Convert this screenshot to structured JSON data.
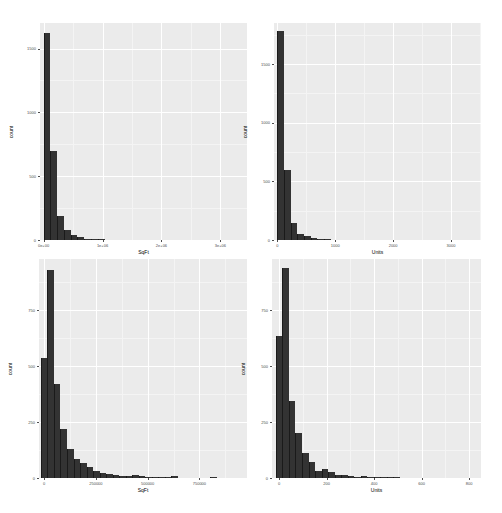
{
  "chart_data": [
    {
      "type": "bar",
      "subtype": "histogram",
      "position": "top-left",
      "title": "",
      "xlabel": "SqFt",
      "ylabel": "count",
      "xlim": [
        -60000,
        3450000
      ],
      "ylim": [
        0,
        1700
      ],
      "x_ticks": [
        {
          "value": 0,
          "label": "0e+00"
        },
        {
          "value": 1000000,
          "label": "1e+06"
        },
        {
          "value": 2000000,
          "label": "2e+06"
        },
        {
          "value": 3000000,
          "label": "3e+06"
        }
      ],
      "y_ticks": [
        {
          "value": 0,
          "label": "0"
        },
        {
          "value": 500,
          "label": "500"
        },
        {
          "value": 1000,
          "label": "1000"
        },
        {
          "value": 1500,
          "label": "1500"
        }
      ],
      "grid": true,
      "bin_width": 115000,
      "bin_start": 0,
      "values": [
        1620,
        695,
        185,
        80,
        40,
        20,
        8,
        5,
        4,
        3,
        2,
        3,
        2,
        2,
        3,
        2,
        2,
        1,
        1,
        2,
        1,
        1,
        1,
        1,
        1,
        2,
        1,
        1,
        1,
        2
      ]
    },
    {
      "type": "bar",
      "subtype": "histogram",
      "position": "top-right",
      "title": "",
      "xlabel": "Units",
      "ylabel": "count",
      "xlim": [
        -60,
        3520
      ],
      "ylim": [
        0,
        1850
      ],
      "x_ticks": [
        {
          "value": 0,
          "label": "0"
        },
        {
          "value": 1000,
          "label": "1000"
        },
        {
          "value": 2000,
          "label": "2000"
        },
        {
          "value": 3000,
          "label": "3000"
        }
      ],
      "y_ticks": [
        {
          "value": 0,
          "label": "0"
        },
        {
          "value": 500,
          "label": "500"
        },
        {
          "value": 1000,
          "label": "1000"
        },
        {
          "value": 1500,
          "label": "1500"
        }
      ],
      "grid": true,
      "bin_width": 115,
      "bin_start": 0,
      "values": [
        1780,
        595,
        145,
        55,
        35,
        20,
        10,
        5,
        4,
        3,
        3,
        2,
        2,
        2,
        1,
        1,
        2,
        1,
        1,
        2,
        1,
        1,
        1,
        1,
        1,
        2,
        1,
        1,
        1,
        1
      ]
    },
    {
      "type": "bar",
      "subtype": "histogram",
      "position": "bottom-left",
      "title": "",
      "xlabel": "SqFt",
      "ylabel": "count",
      "xlim": [
        -25000,
        980000
      ],
      "ylim": [
        0,
        980
      ],
      "x_ticks": [
        {
          "value": 0,
          "label": "0"
        },
        {
          "value": 250000,
          "label": "250000"
        },
        {
          "value": 500000,
          "label": "500000"
        },
        {
          "value": 750000,
          "label": "750000"
        }
      ],
      "y_ticks": [
        {
          "value": 0,
          "label": "0"
        },
        {
          "value": 250,
          "label": "250"
        },
        {
          "value": 500,
          "label": "500"
        },
        {
          "value": 750,
          "label": "750"
        }
      ],
      "grid": true,
      "bin_width": 31500,
      "bin_start": -15750,
      "values": [
        535,
        930,
        420,
        220,
        130,
        85,
        65,
        50,
        30,
        22,
        20,
        12,
        10,
        8,
        12,
        7,
        6,
        4,
        5,
        3,
        8,
        2,
        2,
        2,
        1,
        1,
        3,
        2,
        1,
        1
      ]
    },
    {
      "type": "bar",
      "subtype": "histogram",
      "position": "bottom-right",
      "title": "",
      "xlabel": "Units",
      "ylabel": "count",
      "xlim": [
        -30,
        850
      ],
      "ylim": [
        0,
        980
      ],
      "x_ticks": [
        {
          "value": 0,
          "label": "0"
        },
        {
          "value": 200,
          "label": "200"
        },
        {
          "value": 400,
          "label": "400"
        },
        {
          "value": 600,
          "label": "600"
        },
        {
          "value": 800,
          "label": "800"
        }
      ],
      "y_ticks": [
        {
          "value": 0,
          "label": "0"
        },
        {
          "value": 250,
          "label": "250"
        },
        {
          "value": 500,
          "label": "500"
        },
        {
          "value": 750,
          "label": "750"
        }
      ],
      "grid": true,
      "bin_width": 27.5,
      "bin_start": -13.75,
      "values": [
        635,
        940,
        345,
        200,
        110,
        70,
        30,
        40,
        25,
        15,
        12,
        8,
        6,
        8,
        5,
        4,
        3,
        6,
        3,
        2,
        2,
        2,
        1,
        1,
        1,
        1,
        1,
        1,
        0,
        1
      ]
    }
  ],
  "panels": [
    {
      "xlabel": "SqFt",
      "ylabel": "count"
    },
    {
      "xlabel": "Units",
      "ylabel": "count"
    },
    {
      "xlabel": "SqFt",
      "ylabel": "count"
    },
    {
      "xlabel": "Units",
      "ylabel": "count"
    }
  ],
  "colors": {
    "panel_bg": "#ebebeb",
    "grid": "#ffffff",
    "bar_fill": "#333333",
    "text": "#4d4d4d"
  }
}
